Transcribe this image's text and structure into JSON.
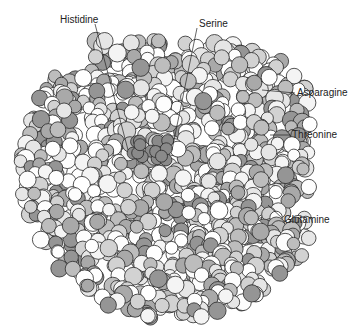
{
  "figure": {
    "labels": [
      {
        "text": "Histidine",
        "x": 60,
        "y": 15,
        "line": [
          [
            95,
            24
          ],
          [
            128,
            150
          ]
        ]
      },
      {
        "text": "Serine",
        "x": 199,
        "y": 19,
        "line": [
          [
            197,
            28
          ],
          [
            172,
            150
          ]
        ]
      },
      {
        "text": "Asparagine",
        "x": 297,
        "y": 88,
        "line": [
          [
            295,
            93
          ],
          [
            262,
            90
          ]
        ]
      },
      {
        "text": "Threonine",
        "x": 292,
        "y": 130,
        "line": [
          [
            290,
            135
          ],
          [
            270,
            135
          ]
        ]
      },
      {
        "text": "Glutamine",
        "x": 284,
        "y": 215,
        "line": [
          [
            282,
            218
          ],
          [
            268,
            205
          ]
        ]
      }
    ],
    "shades": [
      "#ffffff",
      "#f4f4f4",
      "#e6e6e6",
      "#d2d2d2",
      "#bdbdbd",
      "#a9a9a9",
      "#959595",
      "#fdfdfd"
    ],
    "active_site": {
      "cx": 150,
      "cy": 150,
      "color": "#8a8a8a"
    }
  }
}
